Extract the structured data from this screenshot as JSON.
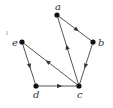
{
  "diagram": {
    "type": "directed-graph",
    "nodes": [
      {
        "id": "a",
        "label": "a",
        "x": 57,
        "y": 15,
        "label_x": 55,
        "label_y": 10
      },
      {
        "id": "b",
        "label": "b",
        "x": 93,
        "y": 42,
        "label_x": 98,
        "label_y": 46
      },
      {
        "id": "c",
        "label": "c",
        "x": 79,
        "y": 86,
        "label_x": 77,
        "label_y": 98
      },
      {
        "id": "d",
        "label": "d",
        "x": 36,
        "y": 86,
        "label_x": 33,
        "label_y": 98
      },
      {
        "id": "e",
        "label": "e",
        "x": 22,
        "y": 42,
        "label_x": 12,
        "label_y": 46
      }
    ],
    "edges": [
      {
        "from": "a",
        "to": "b"
      },
      {
        "from": "b",
        "to": "c"
      },
      {
        "from": "c",
        "to": "a"
      },
      {
        "from": "c",
        "to": "e"
      },
      {
        "from": "e",
        "to": "d"
      },
      {
        "from": "d",
        "to": "c"
      }
    ],
    "stray_mark": {
      "text": "ı",
      "x": 6,
      "y": 35
    },
    "colors": {
      "edge": "#555555",
      "node": "#111111",
      "label": "#333333"
    }
  }
}
